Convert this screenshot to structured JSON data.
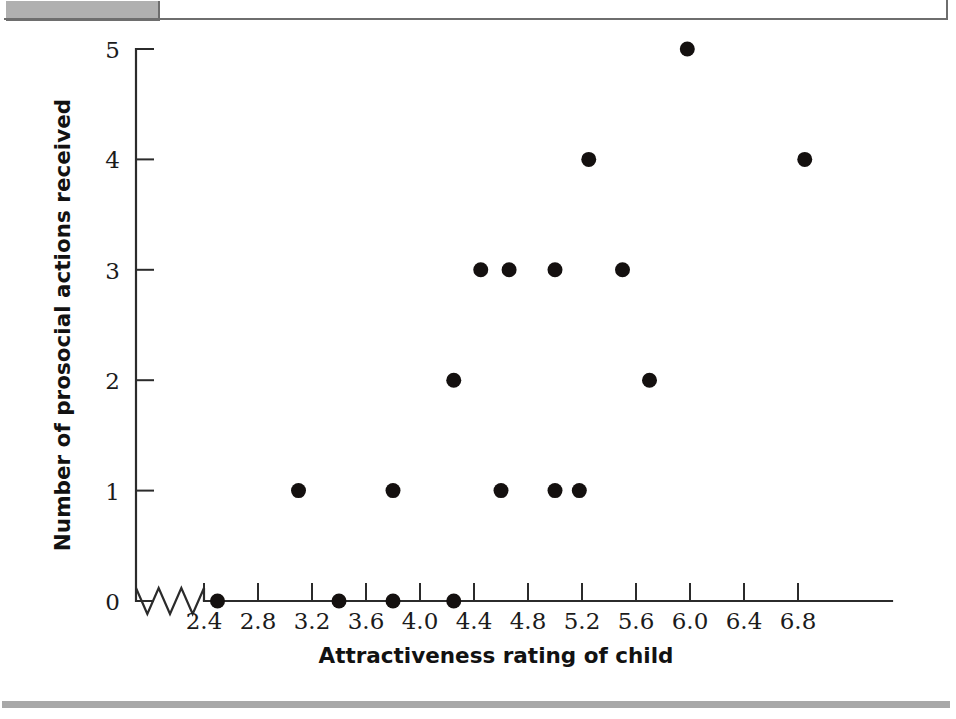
{
  "page": {
    "width": 956,
    "height": 719,
    "background": "#ffffff"
  },
  "decor": {
    "top_tab_color": "#b0b0b0",
    "frame_line_color": "#6e6e6e",
    "bottom_rule_color": "#a8a8a8"
  },
  "chart_data": {
    "type": "scatter",
    "title": "",
    "xlabel": "Attractiveness rating of child",
    "ylabel": "Number of prosocial actions received",
    "xlim": [
      2.2,
      7.3
    ],
    "ylim": [
      0,
      5
    ],
    "grid": false,
    "legend": null,
    "x_ticks": [
      2.4,
      2.8,
      3.2,
      3.6,
      4.0,
      4.4,
      4.8,
      5.2,
      5.6,
      6.0,
      6.4,
      6.8
    ],
    "x_tick_labels": [
      "2.4",
      "2.8",
      "3.2",
      "3.6",
      "4.0",
      "4.4",
      "4.8",
      "5.2",
      "5.6",
      "6.0",
      "6.4",
      "6.8"
    ],
    "y_ticks": [
      0,
      1,
      2,
      3,
      4,
      5
    ],
    "y_tick_labels": [
      "0",
      "1",
      "2",
      "3",
      "4",
      "5"
    ],
    "axis_break": true,
    "marker": "filled-circle",
    "marker_color": "#14100f",
    "marker_size": 8,
    "points": [
      {
        "x": 2.5,
        "y": 0
      },
      {
        "x": 3.4,
        "y": 0
      },
      {
        "x": 3.8,
        "y": 0
      },
      {
        "x": 4.25,
        "y": 0
      },
      {
        "x": 3.1,
        "y": 1
      },
      {
        "x": 3.8,
        "y": 1
      },
      {
        "x": 4.6,
        "y": 1
      },
      {
        "x": 5.0,
        "y": 1
      },
      {
        "x": 5.18,
        "y": 1
      },
      {
        "x": 4.25,
        "y": 2
      },
      {
        "x": 5.7,
        "y": 2
      },
      {
        "x": 4.45,
        "y": 3
      },
      {
        "x": 4.66,
        "y": 3
      },
      {
        "x": 5.0,
        "y": 3
      },
      {
        "x": 5.5,
        "y": 3
      },
      {
        "x": 5.25,
        "y": 4
      },
      {
        "x": 6.85,
        "y": 4
      },
      {
        "x": 5.98,
        "y": 5
      }
    ]
  }
}
